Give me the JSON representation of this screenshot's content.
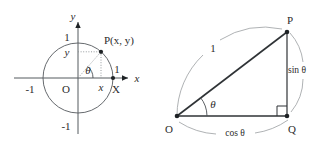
{
  "figure": {
    "left_diagram": {
      "name": "unit-circle",
      "axis_labels": {
        "x": "x",
        "y": "y"
      },
      "tick_labels": {
        "y_top": "1",
        "y_bottom": "-1",
        "x_left": "-1",
        "x_right": "1"
      },
      "origin_label": "O",
      "point_label": "P(x, y)",
      "x_foot_label": "x",
      "y_foot_label": "y",
      "x_intercept_label": "X",
      "angle_label": "θ",
      "circle": {
        "center": [
          0,
          0
        ],
        "radius": 1
      },
      "point": {
        "x": 0.66,
        "y": 0.75
      }
    },
    "right_diagram": {
      "name": "right-triangle",
      "vertices": {
        "origin": "O",
        "top": "P",
        "corner": "Q"
      },
      "hypotenuse_label": "1",
      "opposite_label": "sin θ",
      "adjacent_label": "cos θ",
      "angle_label": "θ",
      "right_angle_at": "Q"
    },
    "colors": {
      "stroke": "#2f3336",
      "axis": "#555a5e",
      "guide": "#9a9ea1",
      "background": "#ffffff",
      "text": "#2b2b2b"
    }
  }
}
